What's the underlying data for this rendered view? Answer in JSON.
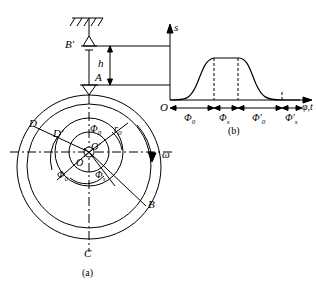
{
  "figure": {
    "caption_a": "(a)",
    "caption_b": "(b)",
    "labels": {
      "B_prime": "B'",
      "A": "A",
      "h": "h",
      "D": "D",
      "D_prime": "D'",
      "O": "O",
      "O_prime": "O'",
      "B": "B",
      "C": "C",
      "omega": "ω",
      "s": "s",
      "phi0_top": "Φ",
      "phi0_top_sub": "0",
      "r0": "r",
      "r0_sub": "0",
      "phi0_lower": "Φ",
      "phi0_lower_sub": "0",
      "phis_lower": "Φ",
      "phis_lower_sub": "s"
    },
    "chart_b": {
      "y_axis": "s",
      "origin": "O",
      "x_axis_label": "φ,t",
      "ticks": [
        {
          "text": "Φ",
          "sub": "0"
        },
        {
          "text": "Φ",
          "sub": "s"
        },
        {
          "text": "Φ'",
          "sub": "0"
        },
        {
          "text": "Φ'",
          "sub": "s"
        }
      ]
    }
  }
}
